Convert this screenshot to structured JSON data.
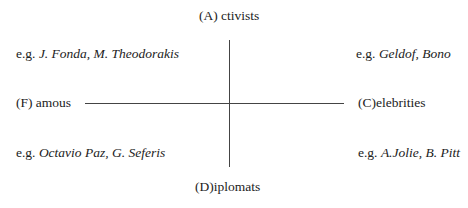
{
  "diagram": {
    "type": "quadrant",
    "axes": {
      "top": "(A) ctivists",
      "bottom": "(D)iplomats",
      "left": "(F) amous",
      "right": "(C)elebrities"
    },
    "quadrants": {
      "top_left": {
        "prefix": "e.g. ",
        "examples": "J. Fonda, M. Theodorakis"
      },
      "top_right": {
        "prefix": "e.g. ",
        "examples": "Geldof, Bono"
      },
      "bottom_left": {
        "prefix": "e.g. ",
        "examples": "Octavio Paz, G. Seferis"
      },
      "bottom_right": {
        "prefix": "e.g. ",
        "examples": "A.Jolie, B. Pitt"
      }
    },
    "colors": {
      "line": "#444444",
      "text": "#222222",
      "background": "#ffffff"
    }
  }
}
